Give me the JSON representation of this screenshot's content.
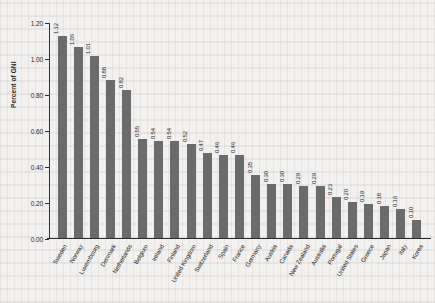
{
  "chart_data": {
    "type": "bar",
    "title": "",
    "xlabel": "",
    "ylabel": "Percent of GNI",
    "ylim": [
      0.0,
      1.2
    ],
    "ytick_labels": [
      "0.00",
      "0.20",
      "0.40",
      "0.60",
      "0.80",
      "1.00",
      "1.20"
    ],
    "ytick_values": [
      0.0,
      0.2,
      0.4,
      0.6,
      0.8,
      1.0,
      1.2
    ],
    "grid": false,
    "legend": null,
    "bar_color": "#6b6b6b",
    "background_color": "#f2f1ef",
    "axis_color": "#333333",
    "value_labels_shown": true,
    "categories": [
      "Sweden",
      "Norway",
      "Luxembourg",
      "Denmark",
      "Netherlands",
      "Belgium",
      "Ireland",
      "Finland",
      "United Kingdom",
      "Switzerland",
      "Spain",
      "France",
      "Germany",
      "Austria",
      "Canada",
      "New Zealand",
      "Australia",
      "Portugal",
      "United States",
      "Greece",
      "Japan",
      "Italy",
      "Korea"
    ],
    "values": [
      1.12,
      1.06,
      1.01,
      0.88,
      0.82,
      0.55,
      0.54,
      0.54,
      0.52,
      0.47,
      0.46,
      0.46,
      0.35,
      0.3,
      0.3,
      0.29,
      0.29,
      0.23,
      0.2,
      0.19,
      0.18,
      0.16,
      0.1
    ],
    "value_labels": [
      "1.12",
      "1.06",
      "1.01",
      "0.88",
      "0.82",
      "0.55",
      "0.54",
      "0.54",
      "0.52",
      "0.47",
      "0.46",
      "0.46",
      "0.35",
      "0.30",
      "0.30",
      "0.29",
      "0.29",
      "0.23",
      "0.20",
      "0.19",
      "0.18",
      "0.16",
      "0.10"
    ]
  }
}
